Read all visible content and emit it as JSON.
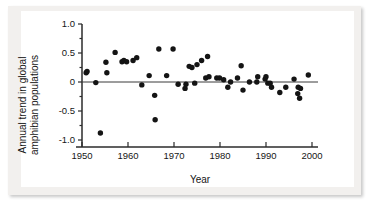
{
  "chart_data": {
    "type": "scatter",
    "title": "",
    "xlabel": "Year",
    "ylabel": "Annual trend in global amphibian populations",
    "xlim": [
      1950,
      2000
    ],
    "ylim": [
      -1.0,
      1.0
    ],
    "xticks": [
      1950,
      1960,
      1970,
      1980,
      1990,
      2000
    ],
    "xtick_labels": [
      "1950",
      "1960",
      "1970",
      "1980",
      "1990",
      "2000"
    ],
    "yticks": [
      1.0,
      0.5,
      0,
      -0.5,
      -1.0
    ],
    "ytick_labels": [
      "1.0",
      "0.5",
      "0",
      "-0.5",
      "-1.0"
    ],
    "minor_yticks": [
      0.75,
      0.25,
      -0.25,
      -0.75
    ],
    "grid": false,
    "legend": null,
    "zero_reference_line": 0,
    "marker": "filled-circle",
    "marker_color": "#141414",
    "series": [
      {
        "name": "Annual trend in global amphibian populations",
        "points": [
          [
            1950.9,
            0.16
          ],
          [
            1951.1,
            0.18
          ],
          [
            1953.0,
            -0.01
          ],
          [
            1955.2,
            0.34
          ],
          [
            1955.4,
            0.16
          ],
          [
            1957.2,
            0.51
          ],
          [
            1958.7,
            0.35
          ],
          [
            1959.1,
            0.37
          ],
          [
            1959.7,
            0.35
          ],
          [
            1961.1,
            0.37
          ],
          [
            1954.0,
            -0.88
          ],
          [
            1961.9,
            0.42
          ],
          [
            1963.0,
            -0.05
          ],
          [
            1965.8,
            -0.23
          ],
          [
            1964.6,
            0.11
          ],
          [
            1966.7,
            0.57
          ],
          [
            1968.4,
            0.11
          ],
          [
            1965.9,
            -0.65
          ],
          [
            1969.8,
            0.57
          ],
          [
            1970.9,
            -0.04
          ],
          [
            1972.6,
            -0.04
          ],
          [
            1973.3,
            0.27
          ],
          [
            1974.5,
            -0.02
          ],
          [
            1973.9,
            0.25
          ],
          [
            1975.0,
            0.3
          ],
          [
            1976.0,
            0.37
          ],
          [
            1977.3,
            0.44
          ],
          [
            1972.4,
            -0.11
          ],
          [
            1976.9,
            0.07
          ],
          [
            1977.6,
            0.09
          ],
          [
            1979.3,
            0.07
          ],
          [
            1979.9,
            0.07
          ],
          [
            1980.8,
            0.04
          ],
          [
            1981.7,
            -0.09
          ],
          [
            1982.3,
            0.0
          ],
          [
            1984.6,
            0.28
          ],
          [
            1983.8,
            0.07
          ],
          [
            1985.0,
            -0.14
          ],
          [
            1986.4,
            0.0
          ],
          [
            1988.0,
            0.0
          ],
          [
            1989.8,
            0.05
          ],
          [
            1990.4,
            -0.02
          ],
          [
            1988.2,
            0.09
          ],
          [
            1990.0,
            0.09
          ],
          [
            1990.9,
            -0.02
          ],
          [
            1991.2,
            -0.09
          ],
          [
            1993.0,
            -0.18
          ],
          [
            1994.3,
            -0.09
          ],
          [
            1996.1,
            0.05
          ],
          [
            1996.9,
            -0.2
          ],
          [
            1997.3,
            -0.28
          ],
          [
            1997.0,
            -0.09
          ],
          [
            1997.5,
            -0.11
          ],
          [
            1999.2,
            0.12
          ]
        ]
      }
    ]
  },
  "axes": {
    "x_label": "Year",
    "y_label_line1": "Annual trend in global",
    "y_label_line2": "amphibian populations"
  }
}
